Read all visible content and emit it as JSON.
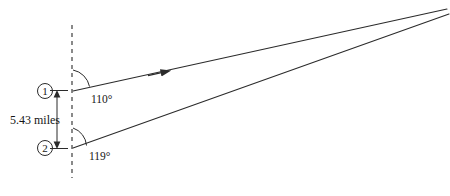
{
  "diagram": {
    "background_color": "#ffffff",
    "line_color": "#2b2b2b",
    "text_color": "#161616",
    "reference_line": {
      "name": "vertical-dashed-reference",
      "style": "dashed",
      "x": 72,
      "y_top": 25,
      "y_bottom": 178
    },
    "stations": [
      {
        "id": "1",
        "label": "①",
        "marker": "circled-one",
        "x": 73,
        "y": 91,
        "angle_label": "110°",
        "angle_value": 110
      },
      {
        "id": "2",
        "label": "②",
        "marker": "circled-two",
        "x": 73,
        "y": 148,
        "angle_label": "119°",
        "angle_value": 119
      }
    ],
    "distance": {
      "label": "5.43 miles",
      "value": 5.43,
      "unit": "miles",
      "dimension_x": 57,
      "y_top": 91,
      "y_bottom": 148
    },
    "convergence_point": {
      "x": 437,
      "y": 12
    },
    "rays": [
      {
        "name": "ray-from-station-1",
        "from_x": 73,
        "from_y": 91,
        "to_x": 447,
        "to_y": 9,
        "has_direction_arrow": true,
        "arrow_at_x": 157,
        "arrow_at_y": 73
      },
      {
        "name": "ray-from-station-2",
        "from_x": 73,
        "from_y": 148,
        "to_x": 449,
        "to_y": 14,
        "has_direction_arrow": false
      }
    ]
  }
}
